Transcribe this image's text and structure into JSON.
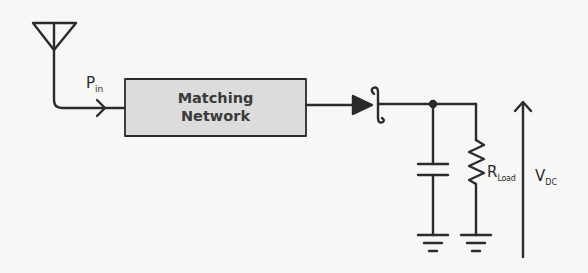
{
  "diagram": {
    "type": "rectenna-circuit",
    "colors": {
      "background": "#f7f7f5",
      "stroke": "#2b2b2b",
      "box_fill": "#dcdcdc"
    },
    "components": {
      "antenna": {
        "icon": "antenna-icon"
      },
      "input_label": {
        "main": "P",
        "sub": "in"
      },
      "matching_network": {
        "line1": "Matching",
        "line2": "Network"
      },
      "diode": {
        "icon": "diode-icon"
      },
      "capacitor": {
        "icon": "capacitor-icon"
      },
      "resistor": {
        "main": "R",
        "sub": "Load"
      },
      "output_voltage": {
        "main": "V",
        "sub": "DC"
      },
      "ground": {
        "icon": "ground-icon"
      }
    }
  }
}
